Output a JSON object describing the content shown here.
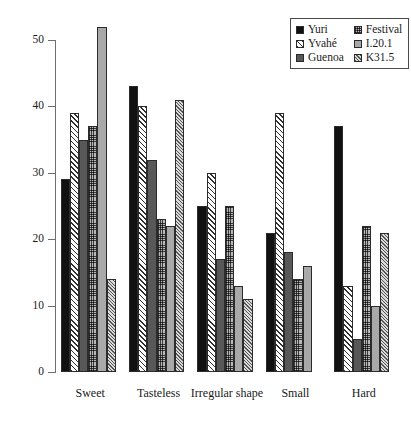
{
  "chart_data": {
    "type": "bar",
    "title": "",
    "subtitle": "",
    "xlabel": "",
    "ylabel": "",
    "categories": [
      "Sweet",
      "Tasteless",
      "Irregular shape",
      "Small",
      "Hard"
    ],
    "series": [
      {
        "name": "Yuri",
        "pattern": "solid-black",
        "color": "#111111",
        "values": [
          29,
          43,
          25,
          21,
          37
        ]
      },
      {
        "name": "Yvahé",
        "pattern": "diagonal-hatch",
        "color": "#2f2f2f",
        "values": [
          39,
          40,
          30,
          39,
          13
        ]
      },
      {
        "name": "Guenoa",
        "pattern": "solid-dark-gray",
        "color": "#585858",
        "values": [
          35,
          32,
          17,
          18,
          5
        ]
      },
      {
        "name": "Festival",
        "pattern": "cross-hatch",
        "color": "#4a4a4a",
        "values": [
          37,
          23,
          25,
          14,
          22
        ]
      },
      {
        "name": "I.20.1",
        "pattern": "solid-gray",
        "color": "#a9a9a9",
        "values": [
          52,
          22,
          13,
          16,
          10
        ]
      },
      {
        "name": "K31.5",
        "pattern": "fine-diagonal",
        "color": "#555555",
        "values": [
          14,
          41,
          11,
          0,
          21
        ]
      }
    ],
    "ylim": [
      0,
      50
    ],
    "yticks": [
      0,
      10,
      20,
      30,
      40,
      50
    ],
    "ytick_labels": [
      "0",
      "10",
      "20",
      "30",
      "40",
      "50"
    ],
    "grid": false,
    "legend_position": "top-right",
    "legend_entries": [
      "Yuri",
      "Yvahé",
      "Guenoa",
      "Festival",
      "I.20.1",
      "K31.5"
    ]
  }
}
